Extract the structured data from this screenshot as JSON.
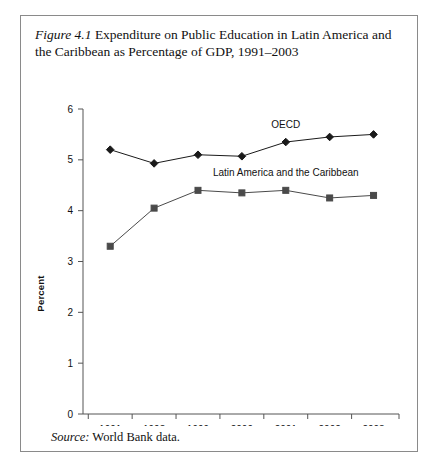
{
  "figure": {
    "label": "Figure 4.1",
    "caption": "Expenditure on Public Education in Latin America and the Caribbean as Percentage of GDP, 1991–2003",
    "source_label": "Source:",
    "source_text": "World Bank data.",
    "border_color": "#8a8a8a"
  },
  "chart_data": {
    "type": "line",
    "title": "Expenditure on Public Education in Latin America and the Caribbean as Percentage of GDP, 1991–2003",
    "xlabel": "",
    "ylabel": "Percent",
    "categories": [
      "1991",
      "1998",
      "1999",
      "2000",
      "2001",
      "2002",
      "2003"
    ],
    "ylim": [
      0,
      6
    ],
    "yticks": [
      0,
      1,
      2,
      3,
      4,
      5,
      6
    ],
    "ytick_labels": [
      "0",
      "1",
      "2",
      "3",
      "4",
      "5",
      "6"
    ],
    "grid": false,
    "legend": "inline-annotations",
    "series": [
      {
        "name": "OECD",
        "marker": "diamond",
        "color": "#1a1a1a",
        "values": [
          5.2,
          4.93,
          5.1,
          5.07,
          5.35,
          5.45,
          5.5
        ]
      },
      {
        "name": "Latin America and the Caribbean",
        "marker": "square",
        "color": "#4a4a4a",
        "values": [
          3.3,
          4.05,
          4.4,
          4.35,
          4.4,
          4.25,
          4.3
        ]
      }
    ],
    "annotations": [
      {
        "text": "OECD",
        "x_category": "2001",
        "value": 5.35,
        "dy": -14
      },
      {
        "text": "Latin America and the Caribbean",
        "x_category": "2001",
        "value": 4.4,
        "dy": -14
      }
    ]
  }
}
